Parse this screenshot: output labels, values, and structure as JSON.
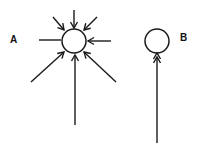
{
  "diagram": {
    "colors": {
      "stroke": "#1a1a1a",
      "background": "#ffffff"
    },
    "panels": [
      {
        "id": "A",
        "label": "A",
        "circle": {
          "cx": 74,
          "cy": 41,
          "r": 12
        },
        "arrows": [
          {
            "name": "top",
            "from": [
              74,
              10
            ],
            "to": [
              74,
              28
            ],
            "head": "single"
          },
          {
            "name": "top-left",
            "from": [
              53,
              17
            ],
            "to": [
              64,
              30
            ],
            "head": "single"
          },
          {
            "name": "top-right",
            "from": [
              97,
              17
            ],
            "to": [
              84,
              30
            ],
            "head": "single"
          },
          {
            "name": "right",
            "from": [
              111,
              41
            ],
            "to": [
              88,
              41
            ],
            "head": "single"
          },
          {
            "name": "bottom-left",
            "from": [
              31,
              82
            ],
            "to": [
              64,
              52
            ],
            "head": "single"
          },
          {
            "name": "bottom",
            "from": [
              75,
              125
            ],
            "to": [
              75,
              55
            ],
            "head": "single"
          },
          {
            "name": "bottom-right",
            "from": [
              116,
              82
            ],
            "to": [
              84,
              52
            ],
            "head": "single"
          }
        ],
        "lines": [
          {
            "name": "left",
            "from": [
              39,
              40
            ],
            "to": [
              61,
              40
            ]
          }
        ]
      },
      {
        "id": "B",
        "label": "B",
        "circle": {
          "cx": 157,
          "cy": 41,
          "r": 12
        },
        "arrows": [
          {
            "name": "bottom",
            "from": [
              157,
              143
            ],
            "to": [
              157,
              57
            ],
            "head": "double"
          }
        ],
        "lines": []
      }
    ]
  }
}
